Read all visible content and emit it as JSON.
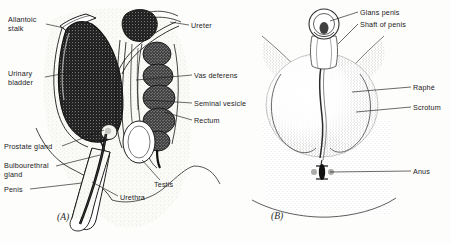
{
  "figure": {
    "background_color": "#fdfdfb",
    "ink_color": "#1b1b1b",
    "panels": [
      {
        "id": "A",
        "id_label": "(A)",
        "description": "Sagittal section of male pelvis showing internal reproductive organs"
      },
      {
        "id": "B",
        "id_label": "(B)",
        "description": "External view of penis, scrotum and perineum"
      }
    ]
  },
  "panel_a": {
    "labels": [
      {
        "key": "allantoic-stalk",
        "text": "Allantoic\nstalk",
        "x": 8,
        "y": 16,
        "align": "left"
      },
      {
        "key": "urinary-bladder",
        "text": "Urinary\nbladder",
        "x": 8,
        "y": 70,
        "align": "left"
      },
      {
        "key": "prostate-gland",
        "text": "Prostate gland",
        "x": 4,
        "y": 143,
        "align": "left"
      },
      {
        "key": "bulbourethral-gland",
        "text": "Bulbourethral\ngland",
        "x": 4,
        "y": 162,
        "align": "left"
      },
      {
        "key": "penis",
        "text": "Penis",
        "x": 4,
        "y": 186,
        "align": "left"
      },
      {
        "key": "ureter",
        "text": "Ureter",
        "x": 191,
        "y": 22,
        "align": "left"
      },
      {
        "key": "vas-deferens",
        "text": "Vas deferens",
        "x": 194,
        "y": 72,
        "align": "left"
      },
      {
        "key": "seminal-vesicle",
        "text": "Seminal vesicle",
        "x": 194,
        "y": 100,
        "align": "left"
      },
      {
        "key": "rectum",
        "text": "Rectum",
        "x": 194,
        "y": 117,
        "align": "left"
      },
      {
        "key": "testis",
        "text": "Testis",
        "x": 154,
        "y": 181,
        "align": "left"
      },
      {
        "key": "urethra",
        "text": "Urethra",
        "x": 120,
        "y": 194,
        "align": "left"
      }
    ]
  },
  "panel_b": {
    "labels": [
      {
        "key": "glans-penis",
        "text": "Glans penis",
        "x": 360,
        "y": 9,
        "align": "left"
      },
      {
        "key": "shaft-of-penis",
        "text": "Shaft of penis",
        "x": 360,
        "y": 21,
        "align": "left"
      },
      {
        "key": "raphe",
        "text": "Raphé",
        "x": 413,
        "y": 84,
        "align": "left"
      },
      {
        "key": "scrotum",
        "text": "Scrotum",
        "x": 413,
        "y": 104,
        "align": "left"
      },
      {
        "key": "anus",
        "text": "Anus",
        "x": 413,
        "y": 168,
        "align": "left"
      }
    ]
  },
  "caption": {
    "partial_text": "                                                                                                         "
  }
}
